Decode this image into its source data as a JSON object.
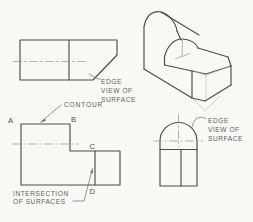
{
  "figure": {
    "background": "#f8f8f6",
    "colors": {
      "outline": "#4c4c4c",
      "centerline": "#949494",
      "construction": "#b9b9b9",
      "leader": "#6e6e6e",
      "text": "#5f5f5f"
    },
    "views": {
      "top_view": {
        "edge_label": {
          "line1": "EDGE",
          "line2": "VIEW OF",
          "line3": "SURFACE"
        }
      },
      "front_view": {
        "contour_label": "CONTOUR",
        "intersection_label_line1": "INTERSECTION",
        "intersection_label_line2": "OF SURFACES",
        "points": {
          "a": "A",
          "b": "B",
          "c": "C",
          "d": "D"
        }
      },
      "side_view": {
        "edge_label": {
          "line1": "EDGE",
          "line2": "VIEW OF",
          "line3": "SURFACE"
        }
      }
    }
  }
}
